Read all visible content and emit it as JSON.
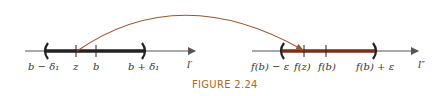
{
  "figure": {
    "caption": "FIGURE 2.24",
    "colors": {
      "axis": "#555555",
      "left_interval": "#222222",
      "right_interval": "#7a2e1a",
      "arc": "#a0522d",
      "caption": "#b5651d"
    }
  },
  "left_line": {
    "axis_label": "l′",
    "labels": {
      "left_end": "b − δ₁",
      "z": "z",
      "b": "b",
      "right_end": "b + δ₁"
    }
  },
  "right_line": {
    "axis_label": "l″",
    "labels": {
      "left_end": "f(b) − ε",
      "fz": "f(z)",
      "fb": "f(b)",
      "right_end": "f(b) + ε"
    }
  },
  "arrow": {
    "from": "z",
    "to": "f(z)"
  }
}
